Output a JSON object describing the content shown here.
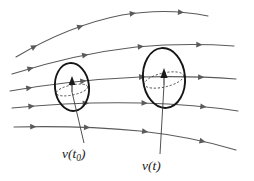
{
  "figure": {
    "background_color": "#ffffff",
    "width": 254,
    "height": 181,
    "colors": {
      "streamline": "#5a5a5a",
      "blob_outline": "#151515",
      "dashed_ellipse": "#3a3a3a",
      "leader": "#3c3c3c",
      "label_text": "#1a1a1a"
    }
  },
  "labels": {
    "left": {
      "symbol": "v",
      "open_paren": "(",
      "arg": "t",
      "subscript": "0",
      "close_paren": ")",
      "full_text": "v(t0)"
    },
    "right": {
      "symbol": "v",
      "open_paren": "(",
      "arg": "t",
      "subscript": "",
      "close_paren": ")",
      "full_text": "v(t)"
    }
  },
  "chart_data": {
    "type": "line",
    "xlabel": "",
    "ylabel": "",
    "xlim": [
      0,
      254
    ],
    "ylim": [
      0,
      181
    ],
    "grid": false,
    "legend": "none",
    "annotations": [
      {
        "text": "v(t0)",
        "x": 82,
        "y": 155
      },
      {
        "text": "v(t)",
        "x": 160,
        "y": 166
      }
    ],
    "series": [
      {
        "name": "streamline-1",
        "path": "M 16,57 C 48,38 86,22 122,15 C 152,10 184,11 208,16",
        "arrow_positions": [
          0.12,
          0.37,
          0.64,
          0.88
        ]
      },
      {
        "name": "streamline-2",
        "path": "M 12,74 C 50,62 92,52 136,47 C 170,44 206,44 234,46",
        "arrow_positions": [
          0.1,
          0.35,
          0.6,
          0.86
        ]
      },
      {
        "name": "streamline-3",
        "path": "M 10,91 C 50,84 96,79 140,77 C 176,76 210,77 236,79",
        "arrow_positions": [
          0.1,
          0.34,
          0.6,
          0.86
        ]
      },
      {
        "name": "streamline-4",
        "path": "M 12,108 C 52,104 98,102 142,103 C 178,104 212,107 238,111",
        "arrow_positions": [
          0.1,
          0.34,
          0.6,
          0.86
        ]
      },
      {
        "name": "streamline-5",
        "path": "M 14,127 C 54,126 98,127 140,131 C 176,135 210,142 236,150",
        "arrow_positions": [
          0.1,
          0.34,
          0.6,
          0.86
        ]
      }
    ],
    "material_volumes": [
      {
        "name": "volume-at-t0",
        "center_x": 72,
        "center_y": 87,
        "rx": 17,
        "ry": 24,
        "rotation": -6,
        "inner_disk_rx": 16,
        "inner_disk_ry": 5,
        "inner_disk_rotation": -12
      },
      {
        "name": "volume-at-t",
        "center_x": 164,
        "center_y": 78,
        "rx": 21,
        "ry": 30,
        "rotation": -5,
        "inner_disk_rx": 20,
        "inner_disk_ry": 7,
        "inner_disk_rotation": -13
      }
    ],
    "velocity_vectors": [
      {
        "name": "vector-at-t0",
        "x": 72,
        "y": 92,
        "dx": 0,
        "dy": -12
      },
      {
        "name": "vector-at-t",
        "x": 164,
        "y": 85,
        "dx": 0,
        "dy": -14
      }
    ],
    "leader_lines": [
      {
        "name": "leader-t0",
        "x1": 72,
        "y1": 92,
        "x2": 84,
        "y2": 143
      },
      {
        "name": "leader-t",
        "x1": 164,
        "y1": 85,
        "x2": 160,
        "y2": 154
      }
    ]
  }
}
